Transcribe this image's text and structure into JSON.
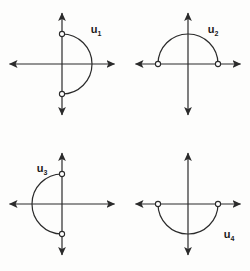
{
  "figure": {
    "title": "",
    "background_color": "#fdfdfc",
    "ink_color": "#2b2b2b",
    "marker_fill": "#ffffff",
    "panel_count": 4
  },
  "chart_data": {
    "type": "scatter",
    "title": "",
    "subtitle": "",
    "xlabel": "",
    "ylabel": "",
    "grid": false,
    "legend_position": "none",
    "panels": [
      {
        "id": "panel-u1",
        "label": "u",
        "subscript": "1",
        "label_x": 96,
        "label_y": 33,
        "center_x": 62,
        "center_y": 64,
        "radius": 30,
        "arc_half": "right",
        "arc_start_deg": 90,
        "arc_end_deg": 270,
        "endpoints": [
          {
            "x": 0,
            "y": 1,
            "open": true
          },
          {
            "x": 0,
            "y": -1,
            "open": true
          }
        ],
        "axis_x_min": -1.75,
        "axis_x_max": 1.75,
        "axis_y_min": -1.7,
        "axis_y_max": 1.7
      },
      {
        "id": "panel-u2",
        "label": "u",
        "subscript": "2",
        "label_x": 213,
        "label_y": 33,
        "center_x": 188,
        "center_y": 64,
        "radius": 30,
        "arc_half": "top",
        "arc_start_deg": 0,
        "arc_end_deg": 180,
        "endpoints": [
          {
            "x": -1,
            "y": 0,
            "open": true
          },
          {
            "x": 1,
            "y": 0,
            "open": true
          }
        ],
        "axis_x_min": -1.75,
        "axis_x_max": 1.75,
        "axis_y_min": -1.7,
        "axis_y_max": 1.7
      },
      {
        "id": "panel-u3",
        "label": "u",
        "subscript": "3",
        "label_x": 42,
        "label_y": 172,
        "center_x": 62,
        "center_y": 204,
        "radius": 30,
        "arc_half": "left",
        "arc_start_deg": 90,
        "arc_end_deg": 270,
        "endpoints": [
          {
            "x": 0,
            "y": 1,
            "open": true
          },
          {
            "x": 0,
            "y": -1,
            "open": true
          }
        ],
        "axis_x_min": -1.75,
        "axis_x_max": 1.75,
        "axis_y_min": -1.7,
        "axis_y_max": 1.7
      },
      {
        "id": "panel-u4",
        "label": "u",
        "subscript": "4",
        "label_x": 229,
        "label_y": 238,
        "center_x": 188,
        "center_y": 204,
        "radius": 30,
        "arc_half": "bottom",
        "arc_start_deg": 180,
        "arc_end_deg": 360,
        "endpoints": [
          {
            "x": -1,
            "y": 0,
            "open": true
          },
          {
            "x": 1,
            "y": 0,
            "open": true
          }
        ],
        "axis_x_min": -1.75,
        "axis_x_max": 1.75,
        "axis_y_min": -1.7,
        "axis_y_max": 1.7
      }
    ]
  }
}
